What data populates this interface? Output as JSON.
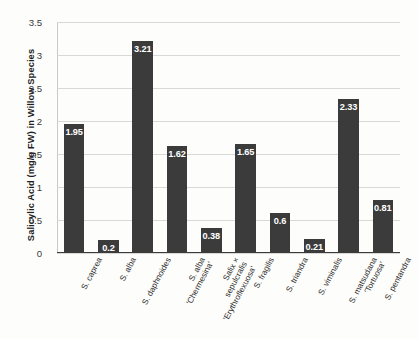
{
  "chart_data": {
    "type": "bar",
    "title": "",
    "xlabel": "",
    "ylabel": "Salicylic Acid (mg/g FW) in Willow Species",
    "ylim": [
      0,
      3.5
    ],
    "yticks": [
      "0",
      "0.5",
      "1",
      "1.5",
      "2",
      "2.5",
      "3",
      "3.5"
    ],
    "grid": true,
    "legend": "none",
    "bar_color": "#3b3b3b",
    "label_color": "#ffffff",
    "categories": [
      "S. caprea",
      "S. alba",
      "S. daphnoides",
      "S. alba\n'Chermesina'",
      "Salix ×\nsepulcralis\n'Erythroflexuosa'",
      "S. fragilis",
      "S. triandra",
      "S. viminalis",
      "S. matsudana\n'Tortuosa'",
      "S. pentandra"
    ],
    "values": [
      1.95,
      0.2,
      3.21,
      1.62,
      0.38,
      1.65,
      0.6,
      0.21,
      2.33,
      0.81
    ],
    "value_labels": [
      "1.95",
      "0.2",
      "3.21",
      "1.62",
      "0.38",
      "1.65",
      "0.6",
      "0.21",
      "2.33",
      "0.81"
    ]
  }
}
